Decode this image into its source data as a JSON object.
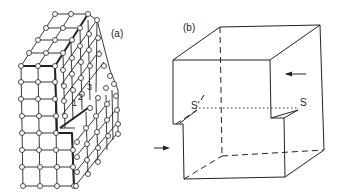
{
  "figure": {
    "panel_a": {
      "label": "(a)",
      "step_labels": [
        "1",
        "2",
        "3"
      ],
      "description": "Crystal lattice block with a screw dislocation step"
    },
    "panel_b": {
      "label": "(b)",
      "point_labels": [
        "S'",
        "S"
      ],
      "description": "Cube with shear displacement; arrows indicate applied shear"
    },
    "colors": {
      "line": "#222222",
      "atom_fill": "#ffffff",
      "background": "#ffffff"
    }
  }
}
